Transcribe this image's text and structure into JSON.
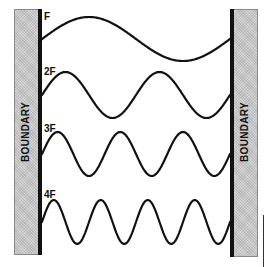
{
  "diagram": {
    "type": "standing-wave-harmonics",
    "boundaries": {
      "left": {
        "label": "BOUNDARY",
        "fill": "#c9c9c9",
        "edge": "#111111"
      },
      "right": {
        "label": "BOUNDARY",
        "fill": "#c9c9c9",
        "edge": "#111111"
      }
    },
    "waves": [
      {
        "label": "F",
        "cycles": 1,
        "baseline_y": 39,
        "amplitude": 22,
        "label_y": 12
      },
      {
        "label": "2F",
        "cycles": 2,
        "baseline_y": 95,
        "amplitude": 23,
        "label_y": 67
      },
      {
        "label": "3F",
        "cycles": 3,
        "baseline_y": 154,
        "amplitude": 22,
        "label_y": 124
      },
      {
        "label": "4F",
        "cycles": 4,
        "baseline_y": 222,
        "amplitude": 22,
        "label_y": 190
      }
    ],
    "wave_span": {
      "x_start": 42,
      "x_end": 230
    },
    "stroke_color": "#111111"
  }
}
